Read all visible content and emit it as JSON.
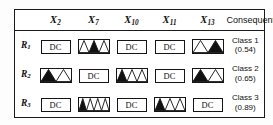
{
  "figure": {
    "name": "fuzzy-rule-table",
    "colors": {
      "ink": "#151515",
      "fill_selected": "#111111",
      "fill_unselected": "#ffffff",
      "background": "#ffffff"
    }
  },
  "table": {
    "corner_label": "",
    "attribute_headers": [
      {
        "base": "X",
        "sub": "2",
        "text": "X2"
      },
      {
        "base": "X",
        "sub": "7",
        "text": "X7"
      },
      {
        "base": "X",
        "sub": "10",
        "text": "X10"
      },
      {
        "base": "X",
        "sub": "11",
        "text": "X11"
      },
      {
        "base": "X",
        "sub": "13",
        "text": "X13"
      }
    ],
    "consequent_header": "Consequent",
    "dont_care_label": "DC",
    "rows": [
      {
        "label_base": "R",
        "label_sub": "1",
        "label_text": "R1",
        "cells": [
          {
            "type": "dc",
            "label": "DC"
          },
          {
            "type": "mf",
            "partitions": 3,
            "selected": 2
          },
          {
            "type": "dc",
            "label": "DC"
          },
          {
            "type": "dc",
            "label": "DC"
          },
          {
            "type": "mf",
            "partitions": 2,
            "selected": 2
          }
        ],
        "consequent": {
          "class": "Class 1",
          "value": "(0.54)",
          "certainty": 0.54
        }
      },
      {
        "label_base": "R",
        "label_sub": "2",
        "label_text": "R2",
        "cells": [
          {
            "type": "mf",
            "partitions": 2,
            "selected": 1
          },
          {
            "type": "dc",
            "label": "DC"
          },
          {
            "type": "mf",
            "partitions": 3,
            "selected": 1
          },
          {
            "type": "dc",
            "label": "DC"
          },
          {
            "type": "mf",
            "partitions": 2,
            "selected": 1
          }
        ],
        "consequent": {
          "class": "Class 2",
          "value": "(0.65)",
          "certainty": 0.65
        }
      },
      {
        "label_base": "R",
        "label_sub": "3",
        "label_text": "R3",
        "cells": [
          {
            "type": "dc",
            "label": "DC"
          },
          {
            "type": "mf",
            "partitions": 4,
            "selected": 1
          },
          {
            "type": "dc",
            "label": "DC"
          },
          {
            "type": "mf",
            "partitions": 3,
            "selected": 1
          },
          {
            "type": "dc",
            "label": "DC"
          }
        ],
        "consequent": {
          "class": "Class 3",
          "value": "(0.89)",
          "certainty": 0.89
        }
      }
    ]
  }
}
